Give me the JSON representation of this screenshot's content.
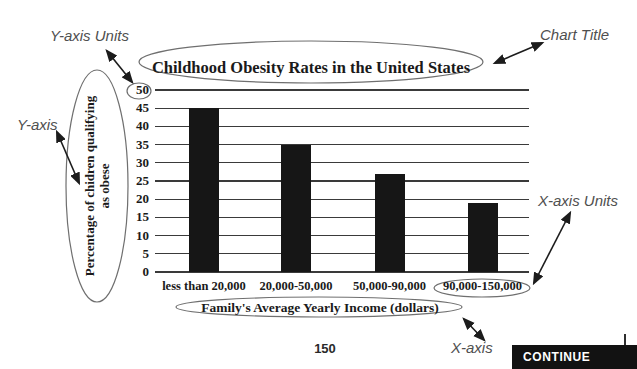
{
  "page": {
    "number": "150"
  },
  "annotations": {
    "y_axis_units": "Y-axis Units",
    "chart_title": "Chart Title",
    "y_axis": "Y-axis",
    "x_axis_units": "X-axis Units",
    "x_axis": "X-axis"
  },
  "continue_button": {
    "label": "CONTINUE"
  },
  "colors": {
    "bar": "#161616",
    "grid": "#3a3a3a",
    "annotation": "#4f4f4f",
    "ellipse": "#6f6f6f",
    "arrow": "#1c1c1c",
    "button_bg": "#121212",
    "button_fg": "#ffffff"
  },
  "chart_data": {
    "type": "bar",
    "title": "Childhood Obesity Rates in the United States",
    "categories": [
      "less than 20,000",
      "20,000-50,000",
      "50,000-90,000",
      "90,000-150,000"
    ],
    "values": [
      45,
      35,
      27,
      19
    ],
    "xlabel": "Family's Average Yearly Income (dollars)",
    "ylabel": "Percentage of chidren qualifying as obese",
    "ylabel_lines": [
      "Percentage of chidren qualifying",
      "as obese"
    ],
    "ylim": [
      0,
      50
    ],
    "ytick_step": 5,
    "yticks": [
      0,
      5,
      10,
      15,
      20,
      25,
      30,
      35,
      40,
      45,
      50
    ],
    "grid": true,
    "legend": false,
    "bar_color": "#161616"
  }
}
